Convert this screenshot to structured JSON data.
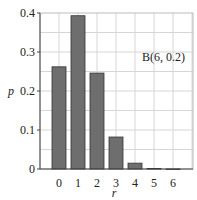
{
  "chart_data": {
    "type": "bar",
    "title": "",
    "annotation": "B(6, 0.2)",
    "categories": [
      "0",
      "1",
      "2",
      "3",
      "4",
      "5",
      "6"
    ],
    "values": [
      0.262,
      0.393,
      0.246,
      0.082,
      0.015,
      0.0015,
      0.0001
    ],
    "xlabel": "r",
    "ylabel": "p",
    "ylim": [
      0,
      0.4
    ],
    "yticks": [
      "0",
      "0.1",
      "0.2",
      "0.3",
      "0.4"
    ],
    "grid": true,
    "bar_color": "#6e6e6e"
  }
}
